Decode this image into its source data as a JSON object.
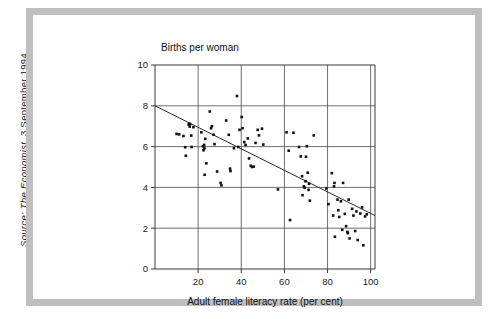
{
  "source_note": {
    "prefix": "Source:",
    "publication": "The Economist",
    "date": ", 3 September 1994.",
    "full": "Source: The Economist, 3 September 1994."
  },
  "chart_data": {
    "type": "scatter",
    "title": "Births per woman",
    "xlabel": "Adult female literacy rate (per cent)",
    "ylabel": "Births per woman",
    "xlim": [
      0,
      102
    ],
    "ylim": [
      0,
      10
    ],
    "xticks": [
      20,
      40,
      60,
      80,
      100
    ],
    "yticks": [
      0,
      2,
      4,
      6,
      8,
      10
    ],
    "xtick_labels": [
      "20",
      "40",
      "60",
      "80",
      "100"
    ],
    "ytick_labels": [
      "0",
      "2",
      "4",
      "6",
      "8",
      "10"
    ],
    "grid": "both",
    "legend": "none",
    "trend_line": {
      "label": "linear fit",
      "x": [
        0,
        102
      ],
      "y": [
        8.0,
        2.62
      ],
      "intercept": 8.0,
      "slope": -0.0527
    },
    "points": [
      [
        10.0,
        6.62
      ],
      [
        11.2,
        6.6
      ],
      [
        13.2,
        6.52
      ],
      [
        14.0,
        5.97
      ],
      [
        14.3,
        5.55
      ],
      [
        15.6,
        7.08
      ],
      [
        15.9,
        7.12
      ],
      [
        16.1,
        6.98
      ],
      [
        16.3,
        7.1
      ],
      [
        16.8,
        6.54
      ],
      [
        17.0,
        5.98
      ],
      [
        17.8,
        6.95
      ],
      [
        21.5,
        6.7
      ],
      [
        22.2,
        6.02
      ],
      [
        22.5,
        5.82
      ],
      [
        22.8,
        6.08
      ],
      [
        22.9,
        5.92
      ],
      [
        23.0,
        4.62
      ],
      [
        23.3,
        6.38
      ],
      [
        23.8,
        5.18
      ],
      [
        25.4,
        7.72
      ],
      [
        26.0,
        6.9
      ],
      [
        26.4,
        7.0
      ],
      [
        27.2,
        6.58
      ],
      [
        27.6,
        6.12
      ],
      [
        28.8,
        4.78
      ],
      [
        30.4,
        4.22
      ],
      [
        30.8,
        4.1
      ],
      [
        33.0,
        7.28
      ],
      [
        34.2,
        6.58
      ],
      [
        34.8,
        4.92
      ],
      [
        35.0,
        4.8
      ],
      [
        36.6,
        5.92
      ],
      [
        38.0,
        8.48
      ],
      [
        38.6,
        5.98
      ],
      [
        39.2,
        6.82
      ],
      [
        40.2,
        7.45
      ],
      [
        40.6,
        6.9
      ],
      [
        41.4,
        6.22
      ],
      [
        42.0,
        6.08
      ],
      [
        43.0,
        6.4
      ],
      [
        43.6,
        5.42
      ],
      [
        44.4,
        5.06
      ],
      [
        45.0,
        5.0
      ],
      [
        45.8,
        5.02
      ],
      [
        46.6,
        6.18
      ],
      [
        47.6,
        6.82
      ],
      [
        48.2,
        6.55
      ],
      [
        49.6,
        6.88
      ],
      [
        50.2,
        6.1
      ],
      [
        57.0,
        3.9
      ],
      [
        61.0,
        6.7
      ],
      [
        62.0,
        5.8
      ],
      [
        62.6,
        2.4
      ],
      [
        64.2,
        6.68
      ],
      [
        66.8,
        5.98
      ],
      [
        67.6,
        5.52
      ],
      [
        68.2,
        4.55
      ],
      [
        68.4,
        3.62
      ],
      [
        69.0,
        4.05
      ],
      [
        69.4,
        3.98
      ],
      [
        69.8,
        4.3
      ],
      [
        70.0,
        5.5
      ],
      [
        70.4,
        6.02
      ],
      [
        70.8,
        4.72
      ],
      [
        71.2,
        3.88
      ],
      [
        71.4,
        4.18
      ],
      [
        71.8,
        3.35
      ],
      [
        73.6,
        6.55
      ],
      [
        79.4,
        3.95
      ],
      [
        80.4,
        3.18
      ],
      [
        82.0,
        4.7
      ],
      [
        82.6,
        2.62
      ],
      [
        83.0,
        4.05
      ],
      [
        83.2,
        4.22
      ],
      [
        83.4,
        1.58
      ],
      [
        84.6,
        3.4
      ],
      [
        85.0,
        2.88
      ],
      [
        85.4,
        2.55
      ],
      [
        86.2,
        3.32
      ],
      [
        86.8,
        1.92
      ],
      [
        87.2,
        4.22
      ],
      [
        88.0,
        2.7
      ],
      [
        88.6,
        2.1
      ],
      [
        89.2,
        1.82
      ],
      [
        89.4,
        1.76
      ],
      [
        89.8,
        3.4
      ],
      [
        90.2,
        1.5
      ],
      [
        91.4,
        2.95
      ],
      [
        92.0,
        2.62
      ],
      [
        92.8,
        1.86
      ],
      [
        93.4,
        2.82
      ],
      [
        94.0,
        1.42
      ],
      [
        95.2,
        2.72
      ],
      [
        96.0,
        3.02
      ],
      [
        96.6,
        1.16
      ],
      [
        97.4,
        2.58
      ],
      [
        98.2,
        2.68
      ]
    ],
    "point_count": 98
  }
}
